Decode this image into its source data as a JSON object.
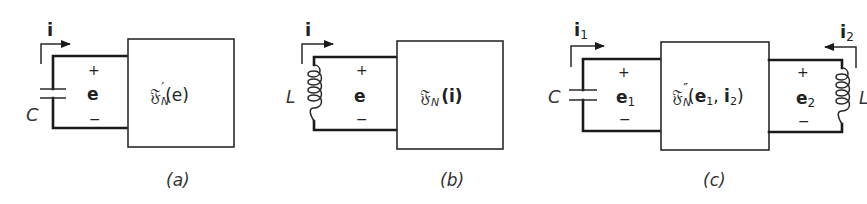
{
  "figure": {
    "panels": [
      {
        "id": "a",
        "caption": "(a)",
        "current_label": "i",
        "current_direction": "right",
        "element": "capacitor",
        "element_label": "C",
        "voltage_label": "e",
        "plus": "+",
        "minus": "−",
        "box_function": "𝔉",
        "box_subscript": "N",
        "box_prime": "′",
        "box_args": "(e)"
      },
      {
        "id": "b",
        "caption": "(b)",
        "current_label": "i",
        "current_direction": "right",
        "element": "inductor",
        "element_label": "L",
        "voltage_label": "e",
        "plus": "+",
        "minus": "−",
        "box_function": "𝔉",
        "box_subscript": "N",
        "box_prime": "",
        "box_args": "(i)"
      },
      {
        "id": "c",
        "caption": "(c)",
        "left": {
          "current_label": "i",
          "current_sub": "1",
          "current_direction": "right",
          "element": "capacitor",
          "element_label": "C",
          "voltage_label": "e",
          "voltage_sub": "1",
          "plus": "+",
          "minus": "−"
        },
        "right": {
          "current_label": "i",
          "current_sub": "2",
          "current_direction": "left",
          "element": "inductor",
          "element_label": "L",
          "voltage_label": "e",
          "voltage_sub": "2",
          "plus": "+",
          "minus": "−"
        },
        "box_function": "𝔉",
        "box_subscript": "N",
        "box_prime": "″",
        "box_args_open": "(",
        "box_arg1": "e",
        "box_arg1_sub": "1",
        "box_sep": ", ",
        "box_arg2": "i",
        "box_arg2_sub": "2",
        "box_args_close": ")"
      }
    ],
    "colors": {
      "ink": "#1a1a1a",
      "background": "#ffffff"
    }
  }
}
